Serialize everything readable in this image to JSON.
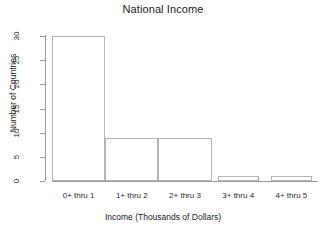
{
  "chart_data": {
    "type": "bar",
    "title": "National Income",
    "xlabel": "Income (Thousands of Dollars)",
    "ylabel": "Number of Countries",
    "categories": [
      "0+ thru 1",
      "1+ thru 2",
      "2+ thru 3",
      "3+ thru 4",
      "4+ thru 5"
    ],
    "values": [
      30,
      9,
      9,
      1,
      1
    ],
    "yticks": [
      0,
      5,
      10,
      15,
      20,
      25,
      30
    ],
    "ytick_labels": [
      "0",
      "5",
      "10",
      "15",
      "20",
      "25",
      "30"
    ],
    "ylim": [
      0,
      30
    ],
    "grid": false,
    "legend": false,
    "bar_fill_color": "#ffffff",
    "bar_border_color": "#b4b4b4",
    "axis_color": "#9a9a9a",
    "text_color": "#2b2b2b",
    "background_color": "#ffffff"
  }
}
